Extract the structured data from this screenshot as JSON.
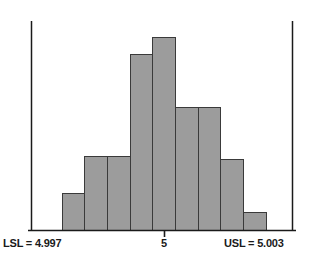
{
  "chart_data": {
    "type": "bar",
    "title": "",
    "subtitle": "",
    "xlabel": "",
    "ylabel": "",
    "grid": false,
    "legend": "none",
    "orientation": "vertical",
    "bar_gap": 0,
    "categories": [
      "bin-1",
      "bin-2",
      "bin-3",
      "bin-4",
      "bin-5",
      "bin-6",
      "bin-7",
      "bin-8",
      "bin-9"
    ],
    "values": [
      37,
      74,
      74,
      176,
      193,
      123,
      123,
      71,
      18
    ],
    "ylim": [
      0,
      209
    ],
    "xlim": [
      4.997,
      5.003
    ],
    "bar_fill_color": "#9c9c9c",
    "bar_stroke_color": "#3a3a3a",
    "axis_color": "#1a1a1a",
    "tick_values": [
      5
    ],
    "tick_labels": [
      "5"
    ],
    "annotations": [
      {
        "name": "lsl-line",
        "label": "LSL = 4.997",
        "value": 4.997
      },
      {
        "name": "usl-line",
        "label": "USL = 5.003",
        "value": 5.003
      }
    ]
  },
  "axis": {
    "center_tick_label": "5"
  },
  "spec_limits": {
    "lower_label": "LSL = 4.997",
    "upper_label": "USL = 5.003",
    "lower_value": "4.997",
    "upper_value": "5.003"
  }
}
